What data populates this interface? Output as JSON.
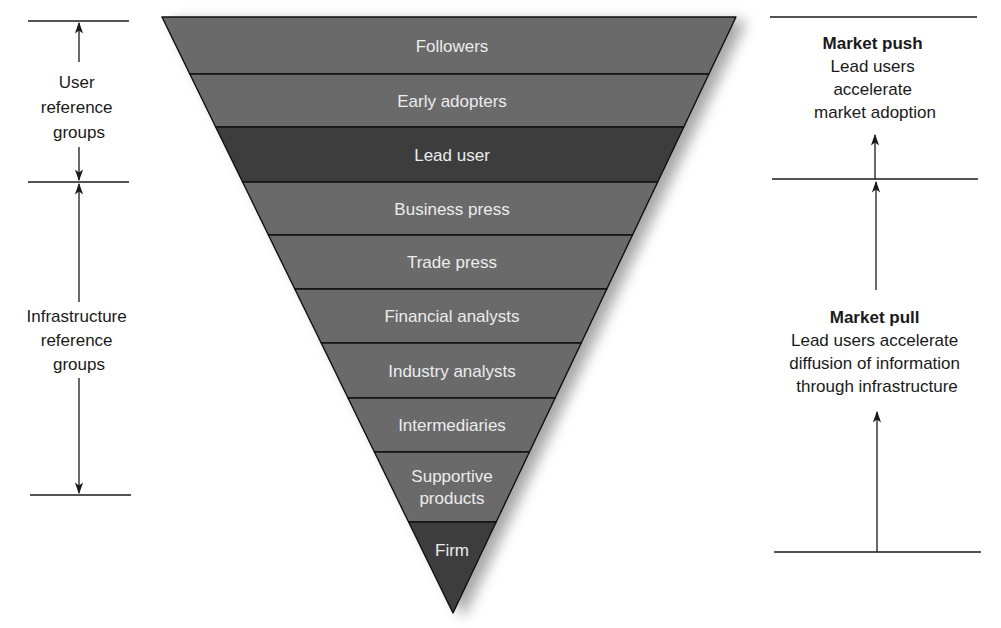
{
  "diagram": {
    "title": "",
    "colors": {
      "band_light": "#6a6a6a",
      "band_dark": "#3d3d3d",
      "band_text": "#ececec",
      "line": "#1a1a1a",
      "background": "#ffffff"
    },
    "funnel": {
      "top_y": 17,
      "top_left_x": 162,
      "top_right_x": 736,
      "apex_x": 453,
      "apex_y": 613,
      "bands": [
        {
          "label": "Followers",
          "lines": [
            "Followers"
          ],
          "y0": 17,
          "y1": 74,
          "shade": "light"
        },
        {
          "label": "Early adopters",
          "lines": [
            "Early adopters"
          ],
          "y0": 74,
          "y1": 127,
          "shade": "light"
        },
        {
          "label": "Lead user",
          "lines": [
            "Lead user"
          ],
          "y0": 127,
          "y1": 182,
          "shade": "dark"
        },
        {
          "label": "Business press",
          "lines": [
            "Business press"
          ],
          "y0": 182,
          "y1": 235,
          "shade": "light"
        },
        {
          "label": "Trade press",
          "lines": [
            "Trade press"
          ],
          "y0": 235,
          "y1": 289,
          "shade": "light"
        },
        {
          "label": "Financial analysts",
          "lines": [
            "Financial analysts"
          ],
          "y0": 289,
          "y1": 343,
          "shade": "light"
        },
        {
          "label": "Industry analysts",
          "lines": [
            "Industry analysts"
          ],
          "y0": 343,
          "y1": 398,
          "shade": "light"
        },
        {
          "label": "Intermediaries",
          "lines": [
            "Intermediaries"
          ],
          "y0": 398,
          "y1": 452,
          "shade": "light"
        },
        {
          "label": "Supportive products",
          "lines": [
            "Supportive",
            "products"
          ],
          "y0": 452,
          "y1": 522,
          "shade": "light"
        },
        {
          "label": "Firm",
          "lines": [
            "Firm"
          ],
          "y0": 522,
          "y1": 613,
          "shade": "dark"
        }
      ]
    },
    "left_annotations": {
      "user_reference_groups": {
        "lines": [
          "User",
          "reference",
          "groups"
        ]
      },
      "infrastructure_reference_groups": {
        "lines": [
          "Infrastructure",
          "reference",
          "groups"
        ]
      }
    },
    "right_annotations": {
      "market_push": {
        "title": "Market push",
        "lines": [
          "Lead users",
          "accelerate",
          "market adoption"
        ]
      },
      "market_pull": {
        "title": "Market pull",
        "lines": [
          "Lead users accelerate",
          "diffusion of information",
          "through infrastructure"
        ]
      }
    }
  }
}
